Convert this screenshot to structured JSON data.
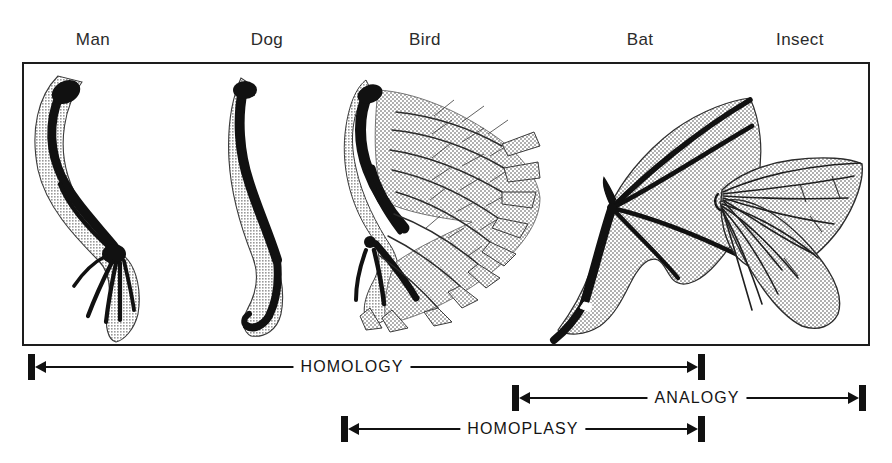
{
  "figure": {
    "type": "scientific-illustration",
    "frame_color": "#1d1d1d",
    "bone_color": "#111111",
    "tissue_color": "#c9c9c9"
  },
  "specimens": [
    {
      "id": "man",
      "label": "Man",
      "label_x": 93,
      "structure": "human arm skeleton in flesh outline"
    },
    {
      "id": "dog",
      "label": "Dog",
      "label_x": 267,
      "structure": "dog foreleg skeleton in flesh outline"
    },
    {
      "id": "bird",
      "label": "Bird",
      "label_x": 425,
      "structure": "bird wing skeleton with feathers"
    },
    {
      "id": "bat",
      "label": "Bat",
      "label_x": 640,
      "structure": "bat wing skeleton with membrane"
    },
    {
      "id": "insect",
      "label": "Insect",
      "label_x": 800,
      "structure": "insect wing with veins"
    }
  ],
  "brackets": [
    {
      "id": "homology",
      "label": "HOMOLOGY",
      "left": 28,
      "right": 705,
      "top": 6,
      "text_x": 352,
      "arrow_left": true,
      "arrow_right": true
    },
    {
      "id": "analogy",
      "label": "ANALOGY",
      "left": 512,
      "right": 866,
      "top": 37,
      "text_x": 697,
      "arrow_left": true,
      "arrow_right": true
    },
    {
      "id": "homoplasy",
      "label": "HOMOPLASY",
      "left": 341,
      "right": 705,
      "top": 68,
      "text_x": 523,
      "arrow_left": true,
      "arrow_right": true
    }
  ]
}
